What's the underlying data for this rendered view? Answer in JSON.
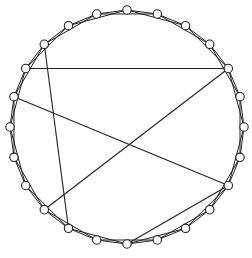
{
  "diagram": {
    "type": "circulant-graph",
    "node_count": 24,
    "ring_offsets": [
      1,
      2
    ],
    "colors": {
      "edge": "#222222",
      "node_fill": "#ffffff",
      "node_stroke": "#222222",
      "background": "#ffffff"
    },
    "chords": [
      {
        "from": 21,
        "to": 14
      },
      {
        "from": 20,
        "to": 4
      },
      {
        "from": 19,
        "to": 8
      },
      {
        "from": 4,
        "to": 15
      },
      {
        "from": 8,
        "to": 12
      }
    ]
  }
}
